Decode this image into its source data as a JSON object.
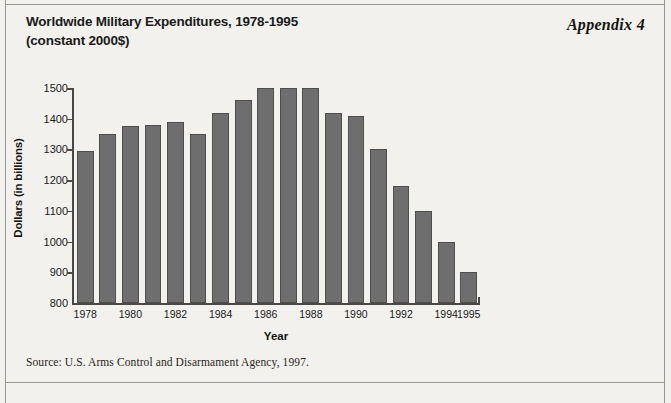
{
  "appendix": {
    "label": "Appendix 4"
  },
  "title": {
    "line1": "Worldwide Military Expenditures, 1978-1995",
    "line2": "(constant 2000$)"
  },
  "source": {
    "text": "Source: U.S. Arms Control and Disarmament Agency, 1997."
  },
  "colors": {
    "page_background": "#f2f1ee",
    "bar_fill": "#6e6e6e",
    "bar_edge": "#4e4e4e",
    "axis": "#4a4844",
    "text": "#1b1b1b"
  },
  "chart_data": {
    "type": "bar",
    "title": "Worldwide Military Expenditures, 1978-1995 (constant 2000$)",
    "xlabel": "Year",
    "ylabel": "Dollars (in billions)",
    "ylim": [
      800,
      1500
    ],
    "yticks": [
      800,
      900,
      1000,
      1100,
      1200,
      1300,
      1400,
      1500
    ],
    "ytick_labels": [
      "800",
      "900",
      "1000",
      "1100",
      "1200",
      "1300",
      "1400",
      "1500"
    ],
    "grid": false,
    "legend": false,
    "categories": [
      1978,
      1979,
      1980,
      1981,
      1982,
      1983,
      1984,
      1985,
      1986,
      1987,
      1988,
      1989,
      1990,
      1991,
      1992,
      1993,
      1994,
      1995
    ],
    "xtick_labels": [
      "1978",
      "1980",
      "1982",
      "1984",
      "1986",
      "1988",
      "1990",
      "1992",
      "1994",
      "1995"
    ],
    "xtick_categories": [
      1978,
      1980,
      1982,
      1984,
      1986,
      1988,
      1990,
      1992,
      1994,
      1995
    ],
    "values": [
      1295,
      1350,
      1375,
      1380,
      1390,
      1350,
      1420,
      1460,
      1500,
      1500,
      1500,
      1420,
      1410,
      1300,
      1180,
      1100,
      1000,
      900
    ],
    "units": "billions of constant 2000 US dollars"
  }
}
